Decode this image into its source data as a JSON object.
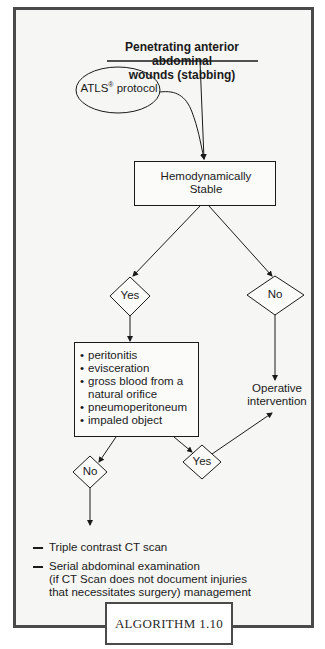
{
  "title": {
    "line1": "Penetrating anterior abdominal",
    "line2": "wounds (stabbing)"
  },
  "protocol": {
    "label": "ATLS",
    "superscript": "®",
    "suffix": " protocol"
  },
  "hemodynamic": {
    "line1": "Hemodynamically",
    "line2": "Stable"
  },
  "decisions": {
    "stable_yes": "Yes",
    "stable_no": "No",
    "findings_no": "No",
    "findings_yes": "Yes"
  },
  "findings": [
    "peritonitis",
    "evisceration",
    "gross blood from a natural orifice",
    "pneumoperitoneum",
    "impaled object"
  ],
  "operative": {
    "line1": "Operative",
    "line2": "intervention"
  },
  "management": {
    "item1": "Triple contrast CT scan",
    "item2": "Serial abdominal examination",
    "item2_note_line1": "(if CT Scan does not document injuries",
    "item2_note_line2": "that necessitates surgery) management"
  },
  "caption": "ALGORITHM 1.10",
  "colors": {
    "frame": "#4a4a4a",
    "background": "#f6f6f4",
    "stroke": "#1a1a1a"
  }
}
